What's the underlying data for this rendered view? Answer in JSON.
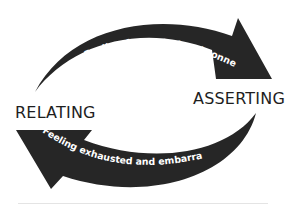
{
  "diagram": {
    "nodes": [
      {
        "id": "relating",
        "label": "RELATING"
      },
      {
        "id": "asserting",
        "label": "ASSERTING"
      }
    ],
    "edges": [
      {
        "from": "relating",
        "to": "asserting",
        "label": "Feeling frustrated and conned"
      },
      {
        "from": "asserting",
        "to": "relating",
        "label": "Feeling exhausted and embarrassed"
      }
    ],
    "colors": {
      "arrow": "#262626",
      "arrow_text": "#ffffff",
      "label": "#1e1e1e"
    }
  }
}
